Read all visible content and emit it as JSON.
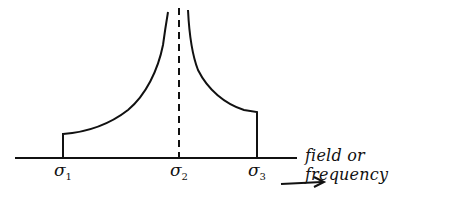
{
  "diagram": {
    "type": "spectral line shape sketch",
    "axis_label": "field or frequency",
    "markers": [
      {
        "symbol": "σ",
        "subscript": "1",
        "x": 63
      },
      {
        "symbol": "σ",
        "subscript": "2",
        "x": 179
      },
      {
        "symbol": "σ",
        "subscript": "3",
        "x": 257
      }
    ],
    "colors": {
      "ink": "#111111",
      "background": "#ffffff"
    },
    "arrow_direction": "right"
  }
}
